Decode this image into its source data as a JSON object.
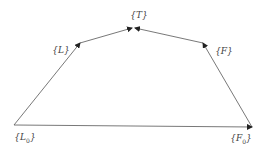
{
  "diagram": {
    "type": "directed-graph",
    "nodes": [
      {
        "id": "L0",
        "label": "{L",
        "sub": "0",
        "close": "}",
        "x": 25,
        "y": 138
      },
      {
        "id": "L",
        "label": "{L}",
        "sub": "",
        "close": "",
        "x": 61,
        "y": 50
      },
      {
        "id": "T",
        "label": "{T}",
        "sub": "",
        "close": "",
        "x": 139,
        "y": 15
      },
      {
        "id": "F",
        "label": "{F}",
        "sub": "",
        "close": "",
        "x": 224,
        "y": 51
      },
      {
        "id": "F0",
        "label": "{F",
        "sub": "0",
        "close": "}",
        "x": 241,
        "y": 139
      }
    ],
    "edges": [
      {
        "from": "L0",
        "to": "L"
      },
      {
        "from": "L",
        "to": "T"
      },
      {
        "from": "F",
        "to": "T"
      },
      {
        "from": "F0",
        "to": "F"
      },
      {
        "from": "L0",
        "to": "F0"
      }
    ]
  }
}
